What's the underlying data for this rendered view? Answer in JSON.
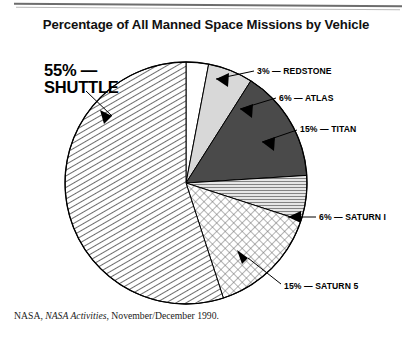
{
  "header": {
    "title": "Percentage of All Manned Space Missions by Vehicle"
  },
  "source": {
    "prefix": "NASA, ",
    "italic": "NASA Activities",
    "suffix": ", November/December 1990."
  },
  "labels": {
    "shuttle": "55% —\nSHUTTLE",
    "redstone": "3% — REDSTONE",
    "atlas": "6% — ATLAS",
    "titan": "15% — TITAN",
    "saturn1": "6% — SATURN I",
    "saturn5": "15% — SATURN 5"
  },
  "chart_data": {
    "type": "pie",
    "title": "Percentage of All Manned Space Missions by Vehicle",
    "xlabel": "",
    "ylabel": "",
    "units": "percent",
    "total": 100,
    "start_angle_deg": 0,
    "direction": "clockwise",
    "legend_position": "callout-labels",
    "grid": false,
    "categories": [
      "REDSTONE",
      "ATLAS",
      "TITAN",
      "SATURN I",
      "SATURN 5",
      "SHUTTLE"
    ],
    "values": [
      3,
      6,
      15,
      6,
      15,
      55
    ],
    "slices": [
      {
        "name": "REDSTONE",
        "value": 3,
        "label": "3% — REDSTONE",
        "fill": "#ffffff",
        "pattern": "solid",
        "stroke": "#000000"
      },
      {
        "name": "ATLAS",
        "value": 6,
        "label": "6% — ATLAS",
        "fill": "#d8d8d8",
        "pattern": "solid",
        "stroke": "#000000"
      },
      {
        "name": "TITAN",
        "value": 15,
        "label": "15% — TITAN",
        "fill": "#4a4a4a",
        "pattern": "solid",
        "stroke": "#000000"
      },
      {
        "name": "SATURN I",
        "value": 6,
        "label": "6% — SATURN I",
        "fill": "#c9c9c9",
        "pattern": "fine-hatch",
        "stroke": "#000000"
      },
      {
        "name": "SATURN 5",
        "value": 15,
        "label": "15% — SATURN 5",
        "fill": "#ffffff",
        "pattern": "cross-dot",
        "stroke": "#000000"
      },
      {
        "name": "SHUTTLE",
        "value": 55,
        "label": "55% — SHUTTLE",
        "fill": "#ffffff",
        "pattern": "diagonal-hatch",
        "stroke": "#000000"
      }
    ]
  },
  "colors": {
    "ink": "#000000",
    "titan_gray": "#4a4a4a",
    "atlas_gray": "#d8d8d8",
    "rule_gray": "#6d6d6d",
    "page_bg": "#ffffff"
  }
}
